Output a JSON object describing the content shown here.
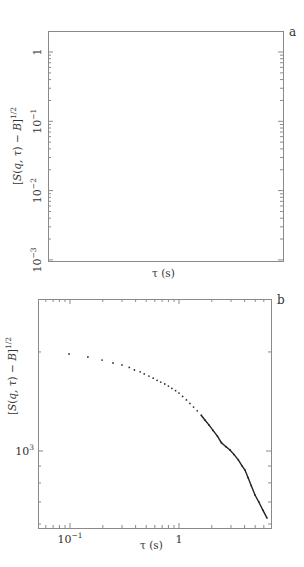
{
  "chart_data": [
    {
      "type": "line",
      "panel_label": "a",
      "title": "",
      "xlabel": "τ (s)",
      "ylabel": "[S(q,τ) − B]^1/2",
      "xscale": "log",
      "yscale": "log",
      "xlim": [
        1e-06,
        0.0032
      ],
      "ylim": [
        0.001,
        2
      ],
      "x_ticks": [
        {
          "base": "10",
          "exp": "−6",
          "value": 1e-06
        },
        {
          "base": "10",
          "exp": "−5",
          "value": 1e-05
        },
        {
          "base": "10",
          "exp": "−4",
          "value": 0.0001
        },
        {
          "base": "10",
          "exp": "−3",
          "value": 0.001
        }
      ],
      "y_ticks": [
        {
          "base": "1",
          "exp": "",
          "value": 1
        },
        {
          "base": "10",
          "exp": "−1",
          "value": 0.1
        },
        {
          "base": "10",
          "exp": "−2",
          "value": 0.01
        },
        {
          "base": "10",
          "exp": "−3",
          "value": 0.001
        }
      ],
      "grid": false,
      "legend": null,
      "series": [
        {
          "name": "data",
          "x": [
            1e-06,
            1e-05,
            3e-05,
            8e-05,
            0.00016,
            0.00027,
            0.00048,
            0.00068,
            0.001,
            0.00126,
            0.00145
          ],
          "values": [
            1.0,
            0.99,
            0.91,
            0.72,
            0.51,
            0.31,
            0.146,
            0.075,
            0.033,
            0.0142,
            0.0102
          ]
        },
        {
          "name": "fit-extension",
          "x": [
            0.00145,
            0.0018,
            0.0022,
            0.0024
          ],
          "values": [
            0.0102,
            0.0045,
            0.0018,
            0.00118
          ]
        }
      ]
    },
    {
      "type": "scatter",
      "panel_label": "b",
      "title": "",
      "xlabel": "τ (s)",
      "ylabel": "[S(q,τ) − B]^1/2",
      "xscale": "log",
      "yscale": "log",
      "xlim": [
        0.051,
        6.9
      ],
      "ylim": [
        600,
        2700
      ],
      "x_ticks": [
        {
          "base": "10",
          "exp": "−1",
          "value": 0.1
        },
        {
          "base": "1",
          "exp": "",
          "value": 1
        }
      ],
      "y_ticks": [
        {
          "base": "10",
          "exp": "3",
          "value": 1000
        }
      ],
      "grid": false,
      "legend": null,
      "series": [
        {
          "name": "data",
          "x": [
            0.098,
            0.146,
            0.197,
            0.248,
            0.3,
            0.35,
            0.39,
            0.44,
            0.48,
            0.53,
            0.58,
            0.63,
            0.68,
            0.74,
            0.8,
            0.86,
            0.93,
            1.0,
            1.08,
            1.17,
            1.26,
            1.36,
            1.47,
            1.6,
            1.73,
            1.88,
            2.05,
            2.25,
            2.45,
            2.7,
            2.94,
            3.2,
            3.5,
            3.8,
            4.03,
            4.3,
            4.6,
            4.98,
            5.4,
            5.9,
            6.41
          ],
          "values": [
            1972,
            1931,
            1890,
            1851,
            1826,
            1795,
            1763,
            1740,
            1715,
            1690,
            1665,
            1640,
            1620,
            1598,
            1575,
            1550,
            1525,
            1500,
            1465,
            1430,
            1395,
            1360,
            1325,
            1285,
            1242,
            1200,
            1155,
            1110,
            1060,
            1030,
            1007,
            975,
            940,
            900,
            875,
            830,
            785,
            735,
            700,
            660,
            626
          ]
        }
      ]
    }
  ]
}
